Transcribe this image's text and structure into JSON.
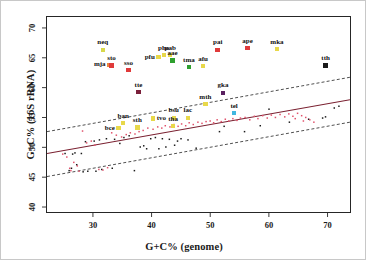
{
  "chart_data": {
    "type": "scatter",
    "title": "",
    "xlabel": "G+C% (genome)",
    "ylabel": "G+C% (16S rRNA)",
    "xlim": [
      22,
      74
    ],
    "ylim": [
      39,
      72
    ],
    "xticks": [
      30,
      40,
      50,
      60,
      70
    ],
    "yticks": [
      40,
      45,
      50,
      55,
      60,
      65,
      70
    ],
    "grid": false,
    "legend": "none",
    "colors": {
      "regression_line": "#7a2030",
      "bounds_line": "#3a3a3a",
      "points_black": "#1a1a1a",
      "points_pink": "#e0506a",
      "frame": "#262626",
      "text": "#111111",
      "image_border": "#c8c8c8"
    },
    "regression": {
      "description": "solid regression line with dashed upper and lower bounds",
      "fit_x": [
        22,
        74
      ],
      "fit_y": [
        48.9,
        58.0
      ],
      "upper_x": [
        22,
        74
      ],
      "upper_y": [
        52.6,
        61.8
      ],
      "lower_x": [
        22,
        74
      ],
      "lower_y": [
        45.0,
        54.2
      ]
    },
    "series": [
      {
        "name": "unlabelled-black",
        "marker": "square",
        "color": "#1a1a1a",
        "points": [
          [
            25.1,
            48.9
          ],
          [
            26.4,
            48.8
          ],
          [
            26.8,
            49.0
          ],
          [
            27.9,
            48.9
          ],
          [
            28.6,
            50.9
          ],
          [
            30.1,
            51.0
          ],
          [
            31.0,
            51.2
          ],
          [
            32.2,
            51.4
          ],
          [
            33.6,
            51.3
          ],
          [
            34.5,
            50.6
          ],
          [
            35.2,
            51.6
          ],
          [
            36.1,
            51.9
          ],
          [
            37.0,
            46.0
          ],
          [
            38.0,
            50.0
          ],
          [
            38.6,
            50.2
          ],
          [
            39.1,
            49.7
          ],
          [
            39.8,
            51.4
          ],
          [
            40.6,
            51.6
          ],
          [
            41.2,
            49.7
          ],
          [
            41.8,
            51.4
          ],
          [
            42.4,
            50.0
          ],
          [
            43.0,
            51.3
          ],
          [
            43.9,
            50.3
          ],
          [
            44.4,
            51.0
          ],
          [
            45.0,
            51.4
          ],
          [
            46.2,
            51.2
          ],
          [
            47.6,
            49.8
          ],
          [
            51.6,
            52.6
          ],
          [
            52.4,
            53.5
          ],
          [
            55.9,
            52.6
          ],
          [
            58.6,
            53.6
          ],
          [
            60.1,
            56.4
          ],
          [
            63.6,
            54.2
          ],
          [
            66.9,
            54.7
          ],
          [
            69.3,
            54.9
          ],
          [
            69.8,
            55.1
          ],
          [
            71.3,
            56.6
          ],
          [
            72.1,
            56.9
          ],
          [
            28.2,
            45.8
          ],
          [
            29.0,
            45.9
          ],
          [
            30.4,
            45.9
          ],
          [
            31.4,
            46.2
          ],
          [
            33.2,
            46.4
          ],
          [
            25.8,
            46.0
          ],
          [
            26.2,
            46.4
          ],
          [
            27.1,
            47.0
          ]
        ]
      },
      {
        "name": "unlabelled-pink",
        "marker": "square",
        "color": "#e0506a",
        "points": [
          [
            24.7,
            48.8
          ],
          [
            25.4,
            48.3
          ],
          [
            25.9,
            46.4
          ],
          [
            26.1,
            46.0
          ],
          [
            26.6,
            47.4
          ],
          [
            27.2,
            46.8
          ],
          [
            27.5,
            45.9
          ],
          [
            28.1,
            52.7
          ],
          [
            28.8,
            50.7
          ],
          [
            29.6,
            51.0
          ],
          [
            30.2,
            50.3
          ],
          [
            30.9,
            46.2
          ],
          [
            31.6,
            46.1
          ],
          [
            32.4,
            46.5
          ],
          [
            33.1,
            52.4
          ],
          [
            33.9,
            52.0
          ],
          [
            34.8,
            51.7
          ],
          [
            35.6,
            52.1
          ],
          [
            36.3,
            52.4
          ],
          [
            37.1,
            52.2
          ],
          [
            37.8,
            52.6
          ],
          [
            38.5,
            52.8
          ],
          [
            39.3,
            53.2
          ],
          [
            40.2,
            53.0
          ],
          [
            41.0,
            53.4
          ],
          [
            41.7,
            53.2
          ],
          [
            42.3,
            53.6
          ],
          [
            43.1,
            53.4
          ],
          [
            43.8,
            53.8
          ],
          [
            44.5,
            53.5
          ],
          [
            45.1,
            53.9
          ],
          [
            45.8,
            53.6
          ],
          [
            46.4,
            54.1
          ],
          [
            47.1,
            53.8
          ],
          [
            47.9,
            54.2
          ],
          [
            48.6,
            54.0
          ],
          [
            49.3,
            54.3
          ],
          [
            50.0,
            54.4
          ],
          [
            50.6,
            54.1
          ],
          [
            51.2,
            54.6
          ],
          [
            51.9,
            54.3
          ],
          [
            52.6,
            54.7
          ],
          [
            53.2,
            54.4
          ],
          [
            53.9,
            54.8
          ],
          [
            54.6,
            54.5
          ],
          [
            55.2,
            54.9
          ],
          [
            56.0,
            55.0
          ],
          [
            56.8,
            54.6
          ],
          [
            57.6,
            55.2
          ],
          [
            58.2,
            54.8
          ],
          [
            59.0,
            55.3
          ],
          [
            59.8,
            54.9
          ],
          [
            60.5,
            55.4
          ],
          [
            61.2,
            55.0
          ],
          [
            62.0,
            55.5
          ],
          [
            62.8,
            55.1
          ],
          [
            63.5,
            55.6
          ],
          [
            64.2,
            55.2
          ],
          [
            65.0,
            55.7
          ],
          [
            65.7,
            55.3
          ],
          [
            66.4,
            55.0
          ],
          [
            67.1,
            54.6
          ],
          [
            67.8,
            54.2
          ],
          [
            64.6,
            54.8
          ],
          [
            66.0,
            54.4
          ]
        ]
      }
    ],
    "labelled_points": [
      {
        "label": "neq",
        "x": 31.5,
        "y": 66.5,
        "color": "#d8d84a",
        "pos": "top"
      },
      {
        "label": "mja",
        "x": 32.6,
        "y": 64.0,
        "color": "#e8863c",
        "pos": "left"
      },
      {
        "label": "sto",
        "x": 33.0,
        "y": 63.9,
        "color": "#e03a3a",
        "pos": "top"
      },
      {
        "label": "sso",
        "x": 35.9,
        "y": 63.1,
        "color": "#e03a3a",
        "pos": "top"
      },
      {
        "label": "tte",
        "x": 37.6,
        "y": 59.4,
        "color": "#7a1f3a",
        "pos": "top"
      },
      {
        "label": "pfu",
        "x": 41.0,
        "y": 65.3,
        "color": "#e8d84a",
        "pos": "left"
      },
      {
        "label": "pho",
        "x": 41.9,
        "y": 65.6,
        "color": "#e8d84a",
        "pos": "top"
      },
      {
        "label": "pab",
        "x": 43.0,
        "y": 65.6,
        "color": "#e8d84a",
        "pos": "top"
      },
      {
        "label": "aae",
        "x": 43.4,
        "y": 64.7,
        "color": "#2fa02f",
        "pos": "top"
      },
      {
        "label": "tma",
        "x": 46.2,
        "y": 63.6,
        "color": "#2fa02f",
        "pos": "top"
      },
      {
        "label": "afu",
        "x": 48.6,
        "y": 63.8,
        "color": "#e8d84a",
        "pos": "top"
      },
      {
        "label": "pai",
        "x": 51.1,
        "y": 66.5,
        "color": "#e03a3a",
        "pos": "top"
      },
      {
        "label": "ape",
        "x": 56.2,
        "y": 66.8,
        "color": "#e03a3a",
        "pos": "top"
      },
      {
        "label": "mka",
        "x": 61.2,
        "y": 66.6,
        "color": "#e8d84a",
        "pos": "top"
      },
      {
        "label": "tth",
        "x": 69.5,
        "y": 63.9,
        "color": "#1a1a1a",
        "pos": "top"
      },
      {
        "label": "gka",
        "x": 52.0,
        "y": 59.3,
        "color": "#5a2060",
        "pos": "top"
      },
      {
        "label": "mth",
        "x": 49.0,
        "y": 57.4,
        "color": "#e8d84a",
        "pos": "top"
      },
      {
        "label": "tel",
        "x": 53.9,
        "y": 55.9,
        "color": "#40b8e0",
        "pos": "top"
      },
      {
        "label": "tvo",
        "x": 40.1,
        "y": 55.0,
        "color": "#e8d84a",
        "pos": "right"
      },
      {
        "label": "ban",
        "x": 35.0,
        "y": 54.2,
        "color": "#e8d84a",
        "pos": "top"
      },
      {
        "label": "bce",
        "x": 34.2,
        "y": 53.4,
        "color": "#e8d84a",
        "pos": "left"
      },
      {
        "label": "sth",
        "x": 37.4,
        "y": 53.5,
        "color": "#e8d84a",
        "pos": "top"
      },
      {
        "label": "bsu",
        "x": 43.6,
        "y": 55.1,
        "color": "#e8d84a",
        "pos": "top"
      },
      {
        "label": "lac",
        "x": 46.0,
        "y": 55.1,
        "color": "#e8d84a",
        "pos": "top"
      },
      {
        "label": "tha",
        "x": 43.5,
        "y": 53.7,
        "color": "#e8d84a",
        "pos": "top"
      }
    ]
  }
}
